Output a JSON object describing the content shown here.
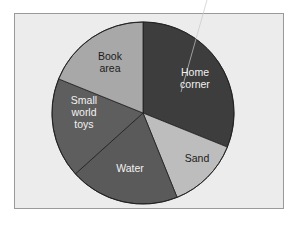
{
  "chart_data": {
    "type": "pie",
    "title": "",
    "start_angle_deg": 0,
    "direction": "clockwise",
    "categories": [
      "Home corner",
      "Sand",
      "Water",
      "Small world toys",
      "Book area"
    ],
    "values": [
      31,
      13,
      19,
      18,
      19
    ],
    "units": "percent (estimated from slice angles)",
    "slices": [
      {
        "label_lines": [
          "Home",
          "corner"
        ],
        "label": "Home corner",
        "value": 31,
        "start": 0,
        "end": 112,
        "color": "#3d3d3d",
        "text_color": "#f2f2f2"
      },
      {
        "label_lines": [
          "Sand"
        ],
        "label": "Sand",
        "value": 13,
        "start": 112,
        "end": 158,
        "color": "#bdbdbd",
        "text_color": "#1c1c1c"
      },
      {
        "label_lines": [
          "Water"
        ],
        "label": "Water",
        "value": 19,
        "start": 158,
        "end": 228,
        "color": "#5a5a5a",
        "text_color": "#f2f2f2"
      },
      {
        "label_lines": [
          "Small",
          "world",
          "toys"
        ],
        "label": "Small world toys",
        "value": 18,
        "start": 228,
        "end": 292,
        "color": "#5e5e5e",
        "text_color": "#f2f2f2"
      },
      {
        "label_lines": [
          "Book",
          "area"
        ],
        "label": "Book area",
        "value": 19,
        "start": 292,
        "end": 360,
        "color": "#a8a8a8",
        "text_color": "#1c1c1c"
      }
    ],
    "legend": "none (labels inside slices)",
    "background": "#ececec",
    "frame_border": "#9a9a9a"
  }
}
